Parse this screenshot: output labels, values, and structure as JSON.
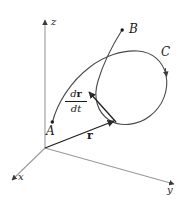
{
  "figure": {
    "background_color": "#ffffff",
    "stroke_color": "#3a3a3a",
    "text_color": "#1a1a1a",
    "width": 186,
    "height": 201
  },
  "axes": {
    "origin_label": "",
    "items": [
      {
        "name": "z-axis",
        "label": "z",
        "direction": "up"
      },
      {
        "name": "x-axis",
        "label": "x",
        "direction": "down-left"
      },
      {
        "name": "y-axis",
        "label": "y",
        "direction": "down-right"
      }
    ]
  },
  "points": [
    {
      "name": "point-a",
      "label": "A",
      "role": "curve-start"
    },
    {
      "name": "point-b",
      "label": "B",
      "role": "curve-end"
    }
  ],
  "curve": {
    "name": "curve-c",
    "label": "C",
    "description": "space curve with a loop from A to B",
    "direction": "clockwise"
  },
  "vectors": [
    {
      "name": "position-vector",
      "label": "r",
      "bold": true,
      "description": "position vector from origin to point on curve"
    },
    {
      "name": "velocity-vector",
      "label_numerator_d": "d",
      "label_numerator_var": "r",
      "label_denominator": "dt",
      "description": "derivative of position with respect to time, tangent to curve"
    }
  ]
}
